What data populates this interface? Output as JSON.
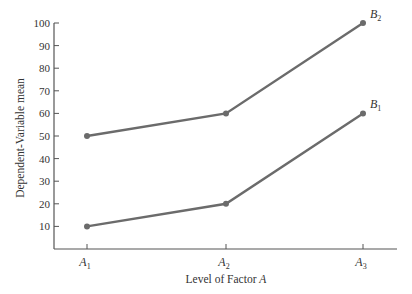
{
  "chart_data": {
    "type": "line",
    "title": "",
    "xlabel": "Level of Factor A",
    "ylabel": "Dependent-Variable mean",
    "categories": [
      "A1",
      "A2",
      "A3"
    ],
    "category_labels": [
      {
        "base": "A",
        "sub": "1"
      },
      {
        "base": "A",
        "sub": "2"
      },
      {
        "base": "A",
        "sub": "3"
      }
    ],
    "series": [
      {
        "name": "B1",
        "label_base": "B",
        "label_sub": "1",
        "values": [
          10,
          20,
          60
        ]
      },
      {
        "name": "B2",
        "label_base": "B",
        "label_sub": "2",
        "values": [
          50,
          60,
          100
        ]
      }
    ],
    "ylim": [
      0,
      100
    ],
    "yticks": [
      10,
      20,
      30,
      40,
      50,
      60,
      70,
      80,
      90,
      100
    ],
    "grid": false,
    "legend": "inline labels at line ends",
    "line_color": "#6b6b6b",
    "axis_color": "#555555"
  }
}
